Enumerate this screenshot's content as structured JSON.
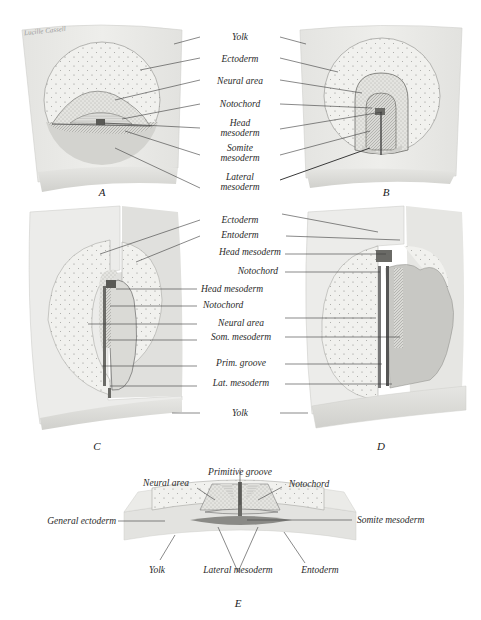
{
  "figure": {
    "signature": "Lucille Cassell",
    "colors": {
      "background": "#ffffff",
      "yolk_block": "#e9e9e6",
      "yolk_edge": "#d6d6d2",
      "ectoderm": "#f1f1ee",
      "neural_area": "#e6e6e2",
      "mesoderm": "#cfcfcb",
      "leader_line": "#3a3a3a",
      "text": "#2a2a2a"
    },
    "panels": {
      "A": {
        "letter": "A"
      },
      "B": {
        "letter": "B"
      },
      "C": {
        "letter": "C"
      },
      "D": {
        "letter": "D"
      },
      "E": {
        "letter": "E"
      }
    },
    "labels_top": {
      "yolk": "Yolk",
      "ectoderm": "Ectoderm",
      "neural_area": "Neural area",
      "notochord": "Notochord",
      "head_mesoderm_1": "Head",
      "head_mesoderm_2": "mesoderm",
      "somite_mesoderm_1": "Somite",
      "somite_mesoderm_2": "mesoderm",
      "lateral_mesoderm_1": "Lateral",
      "lateral_mesoderm_2": "mesoderm"
    },
    "labels_middle": {
      "ectoderm": "Ectoderm",
      "entoderm": "Entoderm",
      "head_mesoderm_d": "Head mesoderm",
      "notochord_d": "Notochord",
      "head_mesoderm_c": "Head mesoderm",
      "notochord_c": "Notochord",
      "neural_area": "Neural area",
      "som_mesoderm": "Som. mesoderm",
      "prim_groove": "Prim. groove",
      "lat_mesoderm": "Lat. mesoderm",
      "yolk": "Yolk"
    },
    "labels_bottom": {
      "primitive_groove": "Primitive groove",
      "neural_area": "Neural area",
      "notochord": "Notochord",
      "general_ectoderm": "General ectoderm",
      "somite_mesoderm": "Somite mesoderm",
      "yolk": "Yolk",
      "lateral_mesoderm": "Lateral mesoderm",
      "entoderm": "Entoderm"
    }
  }
}
